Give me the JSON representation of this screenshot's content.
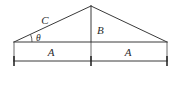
{
  "figure": {
    "background_color": "#ffffff",
    "line_color": "#3a3a3a",
    "label_color": "#2b2b2b"
  },
  "labels": {
    "hypotenuse": "C",
    "height": "B",
    "angle": "θ",
    "base_left": "A",
    "base_right": "A"
  },
  "geometry": {
    "apex": {
      "x": 91,
      "y": 6
    },
    "left_vertex": {
      "x": 14,
      "y": 42
    },
    "right_vertex": {
      "x": 167,
      "y": 42
    },
    "base_midpoint": {
      "x": 91,
      "y": 42
    },
    "dimension_line_y": 61,
    "extension_top_y": 42,
    "angle_arc_radius": 18
  },
  "label_positions": {
    "hypotenuse": {
      "x": 45,
      "y": 24
    },
    "height": {
      "x": 97,
      "y": 34
    },
    "angle": {
      "x": 38,
      "y": 40
    },
    "base_left": {
      "x": 51,
      "y": 56
    },
    "base_right": {
      "x": 128,
      "y": 56
    }
  }
}
